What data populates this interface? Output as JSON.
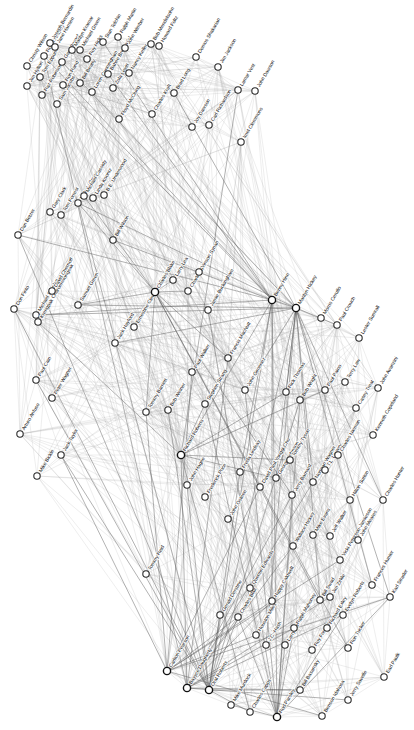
{
  "figure": {
    "type": "network-graph",
    "background_color": "#ffffff",
    "node_fill": "#ffffff",
    "node_stroke": "#2b2b2b",
    "edge_color": "#9a9a9a",
    "label_color": "#111111",
    "label_rotation_deg": -60,
    "width": 414,
    "height": 730
  },
  "chart_data": {
    "type": "scatter",
    "title": "",
    "xlabel": "",
    "ylabel": "",
    "grid": false,
    "legend": null,
    "node_count": 104,
    "nodes": [
      {
        "id": "christy-wilson",
        "label": "Christy Wilson",
        "x": 27,
        "y": 66,
        "hub": false
      },
      {
        "id": "jim-hylton",
        "label": "Jim Hylton",
        "x": 27,
        "y": 86,
        "hub": false
      },
      {
        "id": "tom-elppum",
        "label": "Tom Eppum",
        "x": 40,
        "y": 77,
        "hub": false
      },
      {
        "id": "raz-robinson",
        "label": "Raz Robinson",
        "x": 42,
        "y": 95,
        "hub": false
      },
      {
        "id": "robert-bayley",
        "label": "Robert Bayley",
        "x": 44,
        "y": 56,
        "hub": false
      },
      {
        "id": "joseph-bernardin",
        "label": "Joseph Bernardin",
        "x": 50,
        "y": 43,
        "hub": false
      },
      {
        "id": "jane-hansen",
        "label": "Jane Hansen",
        "x": 55,
        "y": 47,
        "hub": false
      },
      {
        "id": "gary-bergel",
        "label": "Gary Bergel",
        "x": 62,
        "y": 62,
        "hub": false
      },
      {
        "id": "sam-jacobs",
        "label": "Sam Jacobs",
        "x": 57,
        "y": 104,
        "hub": false
      },
      {
        "id": "ron-rand",
        "label": "Ron Rand",
        "x": 63,
        "y": 85,
        "hub": false
      },
      {
        "id": "marilyn-kramar",
        "label": "Marilyn Kramar",
        "x": 72,
        "y": 50,
        "hub": false
      },
      {
        "id": "michael-green",
        "label": "Michael Green",
        "x": 80,
        "y": 50,
        "hub": false
      },
      {
        "id": "bill-beatty",
        "label": "Bill Beatty",
        "x": 80,
        "y": 83,
        "hub": false
      },
      {
        "id": "roy-hicks",
        "label": "Roy Hicks",
        "x": 87,
        "y": 59,
        "hub": false
      },
      {
        "id": "loren-cunningham",
        "label": "Loren Cunningham",
        "x": 92,
        "y": 92,
        "hub": false
      },
      {
        "id": "stan-telchin",
        "label": "Stan Telchin",
        "x": 103,
        "y": 42,
        "hub": false
      },
      {
        "id": "bahee-bressadel",
        "label": "Bahee Bressadel",
        "x": 108,
        "y": 74,
        "hub": false
      },
      {
        "id": "zola-levitt",
        "label": "Zola Levitt",
        "x": 113,
        "y": 88,
        "hub": false
      },
      {
        "id": "ralph-martin",
        "label": "Ralph Martin",
        "x": 118,
        "y": 37,
        "hub": false
      },
      {
        "id": "john-wimber",
        "label": "John Wimber",
        "x": 125,
        "y": 48,
        "hub": false
      },
      {
        "id": "nancy-keller",
        "label": "Nancy Keller",
        "x": 129,
        "y": 73,
        "hub": false
      },
      {
        "id": "floyd-mcclung",
        "label": "Floyd McClung",
        "x": 119,
        "y": 119,
        "hub": false
      },
      {
        "id": "charles-kraft",
        "label": "Charles Kraft",
        "x": 152,
        "y": 114,
        "hub": false
      },
      {
        "id": "bob-mendelsohn",
        "label": "Bob Mendelsohn",
        "x": 151,
        "y": 44,
        "hub": false
      },
      {
        "id": "howard-foltz",
        "label": "Howard Foltz",
        "x": 159,
        "y": 46,
        "hub": false
      },
      {
        "id": "brad-long",
        "label": "Brad Long",
        "x": 174,
        "y": 93,
        "hub": false
      },
      {
        "id": "joy-dawson",
        "label": "Joy Dawson",
        "x": 192,
        "y": 127,
        "hub": false
      },
      {
        "id": "demos-shakarian",
        "label": "Demos Shakarian",
        "x": 196,
        "y": 57,
        "hub": false
      },
      {
        "id": "carl-richardson",
        "label": "Carl Richardson",
        "x": 209,
        "y": 125,
        "hub": false
      },
      {
        "id": "jim-jackson",
        "label": "Jim Jackson",
        "x": 218,
        "y": 67,
        "hub": false
      },
      {
        "id": "lamar-vest",
        "label": "Lamar Vest",
        "x": 238,
        "y": 90,
        "hub": false
      },
      {
        "id": "john-dawson",
        "label": "John Dawson",
        "x": 255,
        "y": 91,
        "hub": false
      },
      {
        "id": "imel-clemmons",
        "label": "Imel Clemmons",
        "x": 241,
        "y": 142,
        "hub": false
      },
      {
        "id": "don-finto",
        "label": "Don Finto",
        "x": 14,
        "y": 309,
        "hub": false
      },
      {
        "id": "dan-betzer",
        "label": "Dan Betzer",
        "x": 18,
        "y": 235,
        "hub": false
      },
      {
        "id": "michael-scanlan",
        "label": "Michael Scanlan",
        "x": 36,
        "y": 315,
        "hub": false
      },
      {
        "id": "krengpak-charoenwongsak",
        "label": "Krengpak Charoenwongsak",
        "x": 38,
        "y": 322,
        "hub": false
      },
      {
        "id": "gary-clark",
        "label": "Gary Clark",
        "x": 50,
        "y": 212,
        "hub": false
      },
      {
        "id": "tom-forrest",
        "label": "Tom Forrest",
        "x": 61,
        "y": 215,
        "hub": false
      },
      {
        "id": "david-chernoff",
        "label": "David Chernoff",
        "x": 52,
        "y": 291,
        "hub": false
      },
      {
        "id": "melody-green",
        "label": "Melody Green",
        "x": 78,
        "y": 203,
        "hub": false
      },
      {
        "id": "michael-cassidy",
        "label": "Michael Cassidy",
        "x": 84,
        "y": 196,
        "hub": false
      },
      {
        "id": "linda-koontz",
        "label": "Linda Koontz",
        "x": 93,
        "y": 198,
        "hub": false
      },
      {
        "id": "be-underwood",
        "label": "B.E. Underwood",
        "x": 104,
        "y": 195,
        "hub": false
      },
      {
        "id": "samuel-green",
        "label": "Samuel Green",
        "x": 78,
        "y": 305,
        "hub": false
      },
      {
        "id": "bill-wilson",
        "label": "Bill Wilson",
        "x": 113,
        "y": 240,
        "hub": false
      },
      {
        "id": "jack-hayford",
        "label": "Jack Hayford",
        "x": 115,
        "y": 343,
        "hub": false
      },
      {
        "id": "ernestine-cleveland-reems",
        "label": "Ernestine Cleveland Reems",
        "x": 134,
        "y": 327,
        "hub": false
      },
      {
        "id": "charles-blake",
        "label": "Charles Blake",
        "x": 155,
        "y": 292,
        "hub": true
      },
      {
        "id": "larry-lea",
        "label": "Larry Lea",
        "x": 173,
        "y": 280,
        "hub": false
      },
      {
        "id": "charles-green",
        "label": "Charles Green",
        "x": 188,
        "y": 291,
        "hub": false
      },
      {
        "id": "vinson-synan",
        "label": "Vinson Synan",
        "x": 199,
        "y": 272,
        "hub": false
      },
      {
        "id": "jamie-buckingham",
        "label": "Jamie Buckingham",
        "x": 208,
        "y": 310,
        "hub": false
      },
      {
        "id": "benny-hinn",
        "label": "Benny Hinn",
        "x": 272,
        "y": 300,
        "hub": true
      },
      {
        "id": "marilyn-hickey",
        "label": "Marilyn Hickey",
        "x": 296,
        "y": 308,
        "hub": true
      },
      {
        "id": "morris-cerullo",
        "label": "Morris Cerullo",
        "x": 321,
        "y": 318,
        "hub": false
      },
      {
        "id": "paul-crouch",
        "label": "Paul Crouch",
        "x": 337,
        "y": 325,
        "hub": false
      },
      {
        "id": "lester-sumrall",
        "label": "Lester Sumrall",
        "x": 359,
        "y": 338,
        "hub": false
      },
      {
        "id": "arturo-anduso",
        "label": "Arturo Anfuso",
        "x": 20,
        "y": 434,
        "hub": false
      },
      {
        "id": "paul-cain",
        "label": "Paul Cain",
        "x": 36,
        "y": 380,
        "hub": false
      },
      {
        "id": "peter-wagner",
        "label": "Peter Wagner",
        "x": 52,
        "y": 398,
        "hub": false
      },
      {
        "id": "mike-bickle",
        "label": "Mike Bickle",
        "x": 37,
        "y": 476,
        "hub": false
      },
      {
        "id": "jack-taylor",
        "label": "Jack Taylor",
        "x": 61,
        "y": 455,
        "hub": false
      },
      {
        "id": "tommy-barnett",
        "label": "Tommy Barnett",
        "x": 146,
        "y": 412,
        "hub": false
      },
      {
        "id": "bob-weiner",
        "label": "Bob Weiner",
        "x": 168,
        "y": 410,
        "hub": false
      },
      {
        "id": "paul-walker",
        "label": "Paul Walker",
        "x": 192,
        "y": 372,
        "hub": false
      },
      {
        "id": "stephen-strang",
        "label": "Stephen Strang",
        "x": 205,
        "y": 404,
        "hub": false
      },
      {
        "id": "francis-macnutt",
        "label": "Francis MacNutt",
        "x": 228,
        "y": 358,
        "hub": false
      },
      {
        "id": "john-gimenez",
        "label": "John Gimenez",
        "x": 245,
        "y": 390,
        "hub": false
      },
      {
        "id": "rick-thomas",
        "label": "Rick Thomas",
        "x": 286,
        "y": 392,
        "hub": false
      },
      {
        "id": "bob-wright",
        "label": "Bob Wright",
        "x": 300,
        "y": 400,
        "hub": false
      },
      {
        "id": "paul-paino",
        "label": "Paul Paino",
        "x": 325,
        "y": 390,
        "hub": false
      },
      {
        "id": "terry-law",
        "label": "Terry Law",
        "x": 345,
        "y": 382,
        "hub": false
      },
      {
        "id": "casey-treat",
        "label": "Casey Treat",
        "x": 356,
        "y": 408,
        "hub": false
      },
      {
        "id": "john-avanzini",
        "label": "John Avanzini",
        "x": 378,
        "y": 388,
        "hub": false
      },
      {
        "id": "richard-roberts",
        "label": "Richard Roberts",
        "x": 181,
        "y": 455,
        "hub": true
      },
      {
        "id": "john-hagee",
        "label": "John Hagee",
        "x": 187,
        "y": 485,
        "hub": false
      },
      {
        "id": "frederick-price",
        "label": "Frederick Price",
        "x": 205,
        "y": 497,
        "hub": false
      },
      {
        "id": "john-osteen",
        "label": "John Osteen",
        "x": 228,
        "y": 519,
        "hub": false
      },
      {
        "id": "freda-lindsay",
        "label": "Freda Lindsay",
        "x": 240,
        "y": 472,
        "hub": false
      },
      {
        "id": "david-paul-yonggi-cho",
        "label": "David Paul Yonggi Cho",
        "x": 260,
        "y": 487,
        "hub": false
      },
      {
        "id": "george-johnson",
        "label": "George Johnson",
        "x": 276,
        "y": 478,
        "hub": false
      },
      {
        "id": "tommy-tyson",
        "label": "Tommy Tyson",
        "x": 290,
        "y": 460,
        "hub": false
      },
      {
        "id": "jerry-barnard",
        "label": "Jerry Barnard",
        "x": 292,
        "y": 495,
        "hub": false
      },
      {
        "id": "norman-wagner",
        "label": "Norman Wagner",
        "x": 313,
        "y": 482,
        "hub": false
      },
      {
        "id": "tl-lowery",
        "label": "T.L. Lowery",
        "x": 325,
        "y": 470,
        "hub": false
      },
      {
        "id": "charles-nieman",
        "label": "Charles Nieman",
        "x": 338,
        "y": 455,
        "hub": false
      },
      {
        "id": "hilton-sutton",
        "label": "Hilton Sutton",
        "x": 350,
        "y": 500,
        "hub": false
      },
      {
        "id": "kenneth-copeland",
        "label": "Kenneth Copeland",
        "x": 373,
        "y": 435,
        "hub": false
      },
      {
        "id": "charles-hunter",
        "label": "Charles Hunter",
        "x": 383,
        "y": 500,
        "hub": false
      },
      {
        "id": "tommy-reid",
        "label": "Tommy Reid",
        "x": 146,
        "y": 574,
        "hub": false
      },
      {
        "id": "carlton-pearson",
        "label": "Carlton Pearson",
        "x": 167,
        "y": 671,
        "hub": true
      },
      {
        "id": "bayyce-daugherty",
        "label": "Bayyce Daugherty",
        "x": 187,
        "y": 688,
        "hub": true
      },
      {
        "id": "gerald-derstine",
        "label": "Gerald Derstine",
        "x": 220,
        "y": 615,
        "hub": false
      },
      {
        "id": "charles-blair",
        "label": "Charles Blair",
        "x": 238,
        "y": 617,
        "hub": false
      },
      {
        "id": "quentin-edwards",
        "label": "Quentin Edwards",
        "x": 250,
        "y": 588,
        "hub": false
      },
      {
        "id": "houston-miles",
        "label": "Houston Miles",
        "x": 256,
        "y": 635,
        "hub": false
      },
      {
        "id": "jc-hash",
        "label": "J.C. Hash",
        "x": 266,
        "y": 645,
        "hub": false
      },
      {
        "id": "oral-roberts",
        "label": "Oral Roberts",
        "x": 209,
        "y": 690,
        "hub": true
      },
      {
        "id": "mike-murdock",
        "label": "Mike Murdock",
        "x": 231,
        "y": 705,
        "hub": false
      },
      {
        "id": "charles-capps",
        "label": "Charles Capps",
        "x": 250,
        "y": 712,
        "hub": false
      },
      {
        "id": "happy-caldwell",
        "label": "Happy Caldwell",
        "x": 272,
        "y": 601,
        "hub": false
      },
      {
        "id": "larry-tomczak",
        "label": "Larry Tomczak",
        "x": 285,
        "y": 645,
        "hub": false
      },
      {
        "id": "ralph-mahoney",
        "label": "Ralph Mahoney",
        "x": 294,
        "y": 628,
        "hub": false
      },
      {
        "id": "rod-parsley",
        "label": "Rod Parsley",
        "x": 277,
        "y": 717,
        "hub": true
      },
      {
        "id": "bill-basansky",
        "label": "Bill Basansky",
        "x": 300,
        "y": 690,
        "hub": false
      },
      {
        "id": "roy-foreman",
        "label": "Roy Foreman",
        "x": 312,
        "y": 650,
        "hub": false
      },
      {
        "id": "bill-swad",
        "label": "Bill Swad",
        "x": 320,
        "y": 600,
        "hub": false
      },
      {
        "id": "jim-zirkle",
        "label": "Jim Zirkle",
        "x": 330,
        "y": 597,
        "hub": false
      },
      {
        "id": "richard-exley",
        "label": "Richard Exley",
        "x": 327,
        "y": 628,
        "hub": false
      },
      {
        "id": "benson-idahosa",
        "label": "Benson Idahosa",
        "x": 322,
        "y": 716,
        "hub": false
      },
      {
        "id": "wallace-hickey",
        "label": "Wallace Hickey",
        "x": 293,
        "y": 546,
        "hub": false
      },
      {
        "id": "mike-evans",
        "label": "Mike Evans",
        "x": 313,
        "y": 535,
        "hub": false
      },
      {
        "id": "jeff-walker",
        "label": "Jeff Walker",
        "x": 330,
        "y": 536,
        "hub": false
      },
      {
        "id": "vicki-peterson-jamieson",
        "label": "Vicki Peterson-Jamieson",
        "x": 340,
        "y": 560,
        "hub": false
      },
      {
        "id": "evelyn-roberts",
        "label": "Evelyn Roberts",
        "x": 343,
        "y": 615,
        "hub": false
      },
      {
        "id": "ron-tucker",
        "label": "Ron Tucker",
        "x": 348,
        "y": 648,
        "hub": false
      },
      {
        "id": "john-meares",
        "label": "John Meares",
        "x": 358,
        "y": 540,
        "hub": false
      },
      {
        "id": "frances-hunter",
        "label": "Frances Hunter",
        "x": 372,
        "y": 585,
        "hub": false
      },
      {
        "id": "karl-strader",
        "label": "Karl Strader",
        "x": 390,
        "y": 597,
        "hub": false
      },
      {
        "id": "jerry-savelle",
        "label": "Jerry Savelle",
        "x": 348,
        "y": 700,
        "hub": false
      },
      {
        "id": "earl-paulk",
        "label": "Earl Paulk",
        "x": 384,
        "y": 677,
        "hub": false
      }
    ],
    "hub_nodes": [
      "benny-hinn",
      "marilyn-hickey",
      "charles-blake",
      "richard-roberts",
      "carlton-pearson",
      "bayyce-daugherty",
      "oral-roberts",
      "rod-parsley"
    ]
  }
}
